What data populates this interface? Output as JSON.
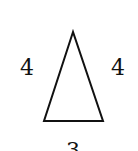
{
  "diagram": {
    "shape": "isosceles-triangle",
    "stroke_color": "#111111",
    "sides": {
      "left": "4",
      "right": "4",
      "base": "3"
    }
  }
}
